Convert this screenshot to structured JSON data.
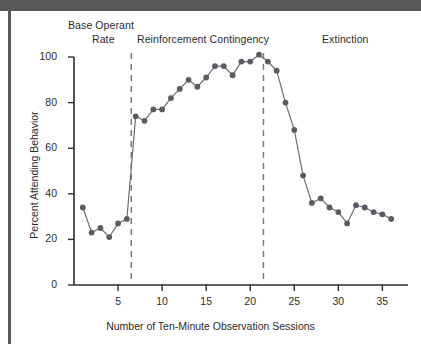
{
  "figure": {
    "phase_labels": [
      {
        "id": "base-1",
        "text": "Base Operant"
      },
      {
        "id": "base-2",
        "text": "Rate"
      },
      {
        "id": "reinforcement",
        "text": "Reinforcement Contingency"
      },
      {
        "id": "extinction",
        "text": "Extinction"
      }
    ]
  },
  "chart_data": {
    "type": "line",
    "title": "",
    "xlabel": "Number of Ten-Minute Observation Sessions",
    "ylabel": "Percent Attending Behavior",
    "xlim": [
      0,
      37
    ],
    "ylim": [
      0,
      100
    ],
    "xticks": [
      5,
      10,
      15,
      20,
      25,
      30,
      35
    ],
    "xtick_labels": [
      "5",
      "10",
      "15",
      "20",
      "25",
      "30",
      "35"
    ],
    "yticks": [
      0,
      20,
      40,
      60,
      80,
      100
    ],
    "ytick_labels": [
      "0",
      "20",
      "40",
      "60",
      "80",
      "100"
    ],
    "grid": false,
    "legend": null,
    "marker": "circle",
    "marker_color": "#5b5b63",
    "line_color": "#6e6e74",
    "phase_dividers": [
      6.5,
      21.5
    ],
    "phase_divider_style": "dashed",
    "x": [
      1,
      2,
      3,
      4,
      5,
      6,
      7,
      8,
      9,
      10,
      11,
      12,
      13,
      14,
      15,
      16,
      17,
      18,
      19,
      20,
      21,
      22,
      23,
      24,
      25,
      26,
      27,
      28,
      29,
      30,
      31,
      32,
      33,
      34,
      35,
      36
    ],
    "values": [
      34,
      23,
      25,
      21,
      27,
      29,
      74,
      72,
      77,
      77,
      82,
      86,
      90,
      87,
      91,
      96,
      96,
      92,
      98,
      98,
      101,
      98,
      94,
      80,
      68,
      48,
      36,
      38,
      34,
      32,
      27,
      35,
      34,
      32,
      31,
      29
    ]
  }
}
